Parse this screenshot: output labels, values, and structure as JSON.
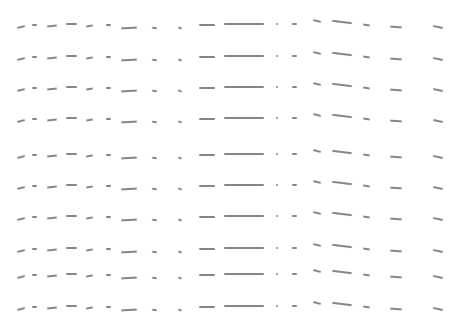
{
  "canvas": {
    "width": 456,
    "height": 326,
    "background": "#ffffff",
    "stroke_color": "#7a7a7a"
  },
  "rows_y": [
    23,
    55,
    86,
    117,
    153,
    184,
    215,
    247,
    273,
    305
  ],
  "strokes": [
    {
      "x": 17,
      "w": 8,
      "dy": 3,
      "h": 2,
      "rot": -14
    },
    {
      "x": 32,
      "w": 5,
      "dy": 1,
      "h": 2,
      "rot": 0
    },
    {
      "x": 47,
      "w": 10,
      "dy": 2,
      "h": 2,
      "rot": -6
    },
    {
      "x": 66,
      "w": 11,
      "dy": 0,
      "h": 2,
      "rot": 0
    },
    {
      "x": 86,
      "w": 7,
      "dy": 2,
      "h": 2,
      "rot": -10
    },
    {
      "x": 106,
      "w": 5,
      "dy": 1,
      "h": 2,
      "rot": 0
    },
    {
      "x": 121,
      "w": 16,
      "dy": 4,
      "h": 2,
      "rot": -3
    },
    {
      "x": 152,
      "w": 5,
      "dy": 4,
      "h": 1.5,
      "rot": 8
    },
    {
      "x": 178,
      "w": 4,
      "dy": 4,
      "h": 1.5,
      "rot": 20
    },
    {
      "x": 199,
      "w": 16,
      "dy": 1,
      "h": 2,
      "rot": 0
    },
    {
      "x": 224,
      "w": 40,
      "dy": 0,
      "h": 2,
      "rot": 0
    },
    {
      "x": 276,
      "w": 2,
      "dy": 0,
      "h": 2,
      "rot": 0
    },
    {
      "x": 292,
      "w": 5,
      "dy": 0,
      "h": 2,
      "rot": 0
    },
    {
      "x": 313,
      "w": 8,
      "dy": -3,
      "h": 2,
      "rot": 14
    },
    {
      "x": 332,
      "w": 20,
      "dy": -2,
      "h": 2,
      "rot": 7
    },
    {
      "x": 363,
      "w": 7,
      "dy": 1,
      "h": 1.5,
      "rot": 10
    },
    {
      "x": 390,
      "w": 12,
      "dy": 3,
      "h": 2,
      "rot": 4
    },
    {
      "x": 433,
      "w": 10,
      "dy": 3,
      "h": 2,
      "rot": 12
    }
  ]
}
